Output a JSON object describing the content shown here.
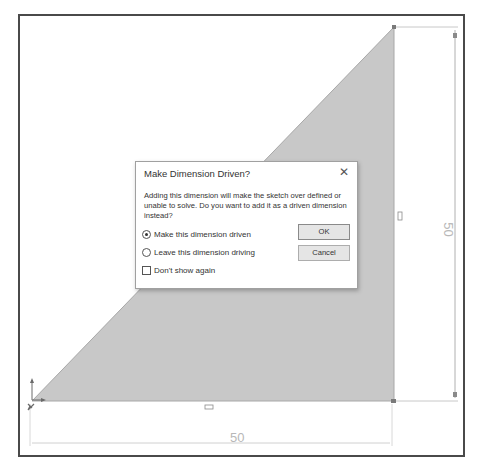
{
  "sketch": {
    "fill_color": "#c8c8c8",
    "line_color": "#a8a8a8",
    "dimension_color": "#b8b8b8",
    "horizontal_dimension": {
      "value_label": "50"
    },
    "vertical_dimension": {
      "value_label": "50"
    }
  },
  "dialog": {
    "title": "Make Dimension Driven?",
    "close_icon": "close-icon",
    "close_glyph": "✕",
    "message": "Adding this dimension will make the sketch over defined or unable to solve.  Do you want to add it as a driven dimension instead?",
    "options": [
      {
        "label": "Make this dimension driven",
        "selected": true
      },
      {
        "label": "Leave this dimension driving",
        "selected": false
      }
    ],
    "dont_show_again": {
      "label": "Don't show again",
      "checked": false
    },
    "buttons": {
      "ok": "OK",
      "cancel": "Cancel"
    }
  }
}
